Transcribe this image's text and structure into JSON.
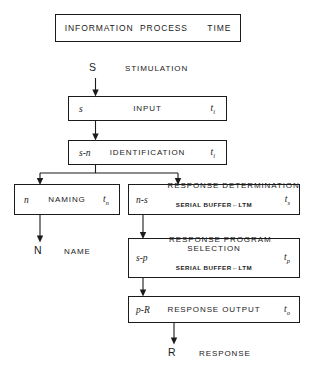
{
  "figure": {
    "title_box": "INFORMATION  PROCESS      TIME",
    "entry": {
      "node": "S",
      "label": "STIMULATION"
    },
    "exit_name": {
      "node": "N",
      "label": "NAME"
    },
    "exit_response": {
      "node": "R",
      "label": "RESPONSE"
    },
    "caption_partial": "",
    "stages": [
      {
        "id": "input",
        "code": "s",
        "label": "INPUT",
        "sublabel": "",
        "time": "t",
        "time_sub": "i"
      },
      {
        "id": "identification",
        "code": "s-n",
        "label": "IDENTIFICATION",
        "sublabel": "",
        "time": "t",
        "time_sub": "i"
      },
      {
        "id": "naming",
        "code": "n",
        "label": "NAMING",
        "sublabel": "",
        "time": "t",
        "time_sub": "n"
      },
      {
        "id": "response-determination",
        "code": "n-s",
        "label": "RESPONSE DETERMINATION",
        "sublabel": "SERIAL BUFFER←LTM",
        "time": "t",
        "time_sub": "s"
      },
      {
        "id": "response-program-selection",
        "code": "s-p",
        "label": "RESPONSE PROGRAM\nSELECTION",
        "sublabel": "SERIAL BUFFER←LTM",
        "time": "t",
        "time_sub": "p"
      },
      {
        "id": "response-output",
        "code": "p-R",
        "label": "RESPONSE OUTPUT",
        "sublabel": "",
        "time": "t",
        "time_sub": "o"
      }
    ],
    "colors": {
      "ink": "#1b1b1b",
      "paper": "#ffffff"
    }
  }
}
